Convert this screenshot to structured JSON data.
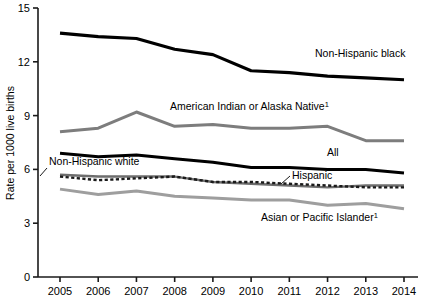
{
  "chart_data": {
    "type": "line",
    "title": "",
    "xlabel": "",
    "ylabel": "Rate per 1000 live births",
    "x": [
      2005,
      2006,
      2007,
      2008,
      2009,
      2010,
      2011,
      2012,
      2013,
      2014
    ],
    "xtick_labels": [
      "2005",
      "2006",
      "2007",
      "2008",
      "2009",
      "2010",
      "2011",
      "2012",
      "2013",
      "2014"
    ],
    "ytick_labels": [
      "0",
      "3",
      "6",
      "9",
      "12",
      "15"
    ],
    "yticks": [
      0,
      3,
      6,
      9,
      12,
      15
    ],
    "ylim": [
      0,
      15
    ],
    "xlim": [
      2005,
      2014
    ],
    "grid": false,
    "legend_position": "inline-annotations",
    "series": [
      {
        "name": "Non-Hispanic black",
        "label": "Non-Hispanic black",
        "color": "#000000",
        "style": "solid",
        "width": 3.2,
        "values": [
          13.6,
          13.4,
          13.3,
          12.7,
          12.4,
          11.5,
          11.4,
          11.2,
          11.1,
          11.0
        ]
      },
      {
        "name": "American Indian or Alaska Native",
        "label": "American Indian or Alaska Native",
        "footnote": "1",
        "color": "#7d7d7d",
        "style": "solid",
        "width": 3.0,
        "values": [
          8.1,
          8.3,
          9.2,
          8.4,
          8.5,
          8.3,
          8.3,
          8.4,
          7.6,
          7.6
        ]
      },
      {
        "name": "All",
        "label": "All",
        "color": "#000000",
        "style": "solid",
        "width": 3.0,
        "values": [
          6.9,
          6.7,
          6.8,
          6.6,
          6.4,
          6.1,
          6.1,
          6.0,
          6.0,
          5.8
        ]
      },
      {
        "name": "Non-Hispanic white",
        "label": "Non-Hispanic white",
        "color": "#6e6e6e",
        "style": "solid",
        "width": 2.4,
        "values": [
          5.7,
          5.6,
          5.6,
          5.6,
          5.3,
          5.2,
          5.1,
          5.0,
          5.1,
          5.1
        ]
      },
      {
        "name": "Hispanic",
        "label": "Hispanic",
        "color": "#1a1a1a",
        "style": "dashed",
        "width": 2.4,
        "values": [
          5.6,
          5.4,
          5.5,
          5.6,
          5.3,
          5.3,
          5.2,
          5.1,
          5.0,
          5.0
        ]
      },
      {
        "name": "Asian or Pacific Islander",
        "label": "Asian or Pacific Islander",
        "footnote": "1",
        "color": "#9e9e9e",
        "style": "solid",
        "width": 3.0,
        "values": [
          4.9,
          4.6,
          4.8,
          4.5,
          4.4,
          4.3,
          4.3,
          4.0,
          4.1,
          3.8
        ]
      }
    ],
    "annotations": [
      {
        "text": "Non-Hispanic black",
        "x": 315,
        "y": 57,
        "anchor": "start",
        "leader": false
      },
      {
        "text": "American Indian or Alaska Native",
        "footnote": "1",
        "x": 170,
        "y": 110,
        "anchor": "start",
        "leader": false
      },
      {
        "text": "All",
        "x": 327,
        "y": 156,
        "anchor": "start",
        "leader": false
      },
      {
        "text": "Non-Hispanic white",
        "x": 49,
        "y": 165,
        "anchor": "start",
        "leader": true,
        "leader_from": [
          47,
          168
        ],
        "leader_to": [
          40,
          176
        ]
      },
      {
        "text": "Hispanic",
        "x": 292,
        "y": 179,
        "anchor": "start",
        "leader": true,
        "leader_from": [
          290,
          176
        ],
        "leader_to": [
          281,
          184
        ]
      },
      {
        "text": "Asian or Pacific Islander",
        "footnote": "1",
        "x": 261,
        "y": 221,
        "anchor": "start",
        "leader": false
      }
    ]
  },
  "accent_colors": {
    "black": "#000000",
    "dark_gray": "#7d7d7d",
    "mid_gray": "#6e6e6e",
    "light_gray": "#9e9e9e",
    "axis": "#1a1a1a",
    "background": "#ffffff"
  }
}
